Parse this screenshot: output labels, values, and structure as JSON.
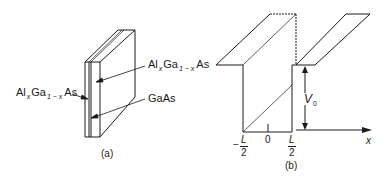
{
  "panel_a": {
    "caption": "(a)",
    "labels": {
      "top_right": {
        "base1": "Al",
        "sub1": "x",
        "base2": "Ga",
        "sub2": "1 − x",
        "base3": "As"
      },
      "left": {
        "base1": "Al",
        "sub1": "x",
        "base2": "Ga",
        "sub2": "1 − x",
        "base3": "As"
      },
      "middle_right": "GaAs"
    }
  },
  "panel_b": {
    "caption": "(b)",
    "axis_label": "x",
    "ticks": {
      "left": {
        "sign": "−",
        "num": "L",
        "den": "2"
      },
      "center": "0",
      "right": {
        "num": "L",
        "den": "2"
      }
    },
    "barrier_label": {
      "base": "V",
      "sub": "0"
    }
  },
  "colors": {
    "line": "#1a1a1a",
    "background": "#ffffff"
  }
}
